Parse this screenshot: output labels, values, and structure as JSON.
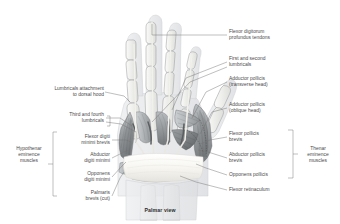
{
  "figure": {
    "caption": "Palmar view",
    "background_color": "#ffffff",
    "line_color": "#6f6f6f",
    "text_color": "#4a4a4a"
  },
  "labels_right": [
    {
      "id": "flexor-digitorum-profundus-tendons",
      "text": "Flexor digitorum\nprofundus tendons"
    },
    {
      "id": "first-and-second-lumbricals",
      "text": "First and second\nlumbricals"
    },
    {
      "id": "adductor-pollicis-transverse-head",
      "text": "Adductor pollicis\n(transverse head)"
    },
    {
      "id": "adductor-pollicis-oblique-head",
      "text": "Adductor pollicis\n(oblique head)"
    },
    {
      "id": "flexor-pollicis-brevis",
      "text": "Flexor pollicis\nbrevis"
    },
    {
      "id": "abductor-pollicis-brevis",
      "text": "Abductor pollicis\nbrevis"
    },
    {
      "id": "opponens-pollicis",
      "text": "Opponens pollicis"
    },
    {
      "id": "flexor-retinaculum",
      "text": "Flexor retinaculum"
    }
  ],
  "labels_left": [
    {
      "id": "lumbricals-attachment-to-dorsal-hood",
      "text": "Lumbricals attachment\nto dorsal hood"
    },
    {
      "id": "third-and-fourth-lumbricals",
      "text": "Third and fourth\nlumbricals"
    },
    {
      "id": "flexor-digiti-minimi-brevis",
      "text": "Flexor digiti\nminimi brevis"
    },
    {
      "id": "abductor-digiti-minimi",
      "text": "Abductor\ndigiti minimi"
    },
    {
      "id": "opponens-digiti-minimi",
      "text": "Opponens\ndigiti minimi"
    },
    {
      "id": "palmaris-brevis-cut",
      "text": "Palmaris\nbrevis (cut)"
    }
  ],
  "group_brackets": [
    {
      "id": "hypothenar-eminence-muscles",
      "text": "Hypothenar\neminence\nmuscles",
      "side": "left"
    },
    {
      "id": "thenar-eminence-muscles",
      "text": "Thenar\neminence\nmuscles",
      "side": "right"
    }
  ],
  "illustration": {
    "subject": "human hand dissection, palmar aspect",
    "palette": {
      "skin_outline": "#cfd1d4",
      "skin_fill": "#e9eaec",
      "bone_fill": "#f2f2f0",
      "bone_outline": "#8a8d90",
      "muscle_dark": "#6b6d70",
      "muscle_mid": "#8d9093",
      "muscle_light": "#b6b9bc",
      "tendon": "#f5f5f2",
      "retinaculum": "#fbfbf8"
    }
  }
}
